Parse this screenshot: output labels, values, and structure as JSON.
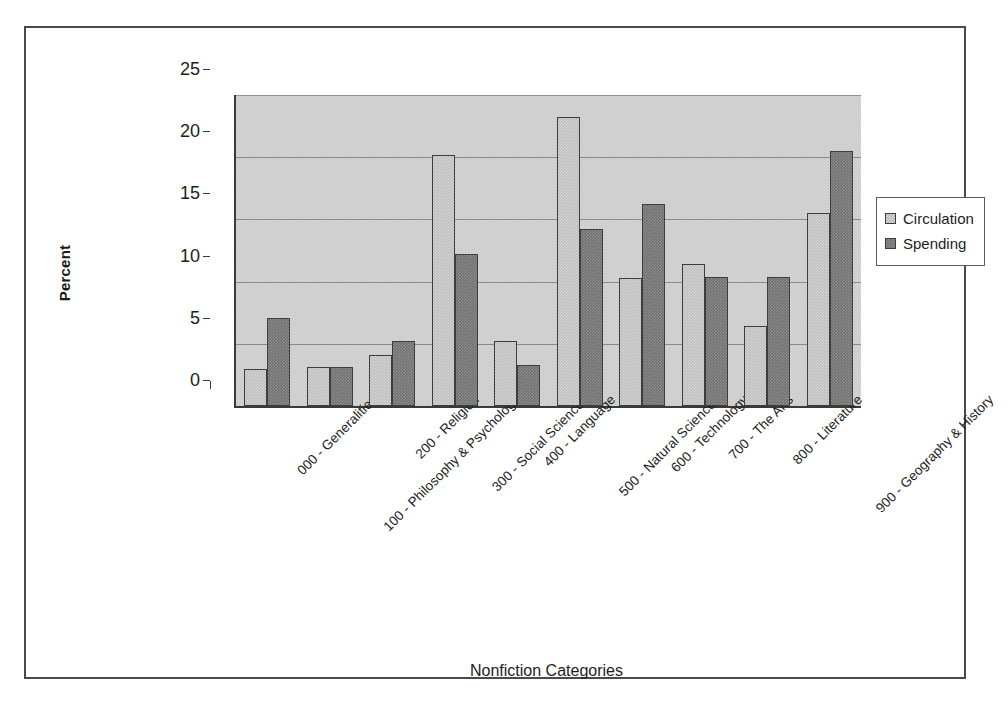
{
  "chart_data": {
    "type": "bar",
    "title": "",
    "xlabel": "Nonfiction Categories",
    "ylabel": "Percent",
    "ylim": [
      0,
      25
    ],
    "ytick_labels": [
      "25",
      "20",
      "15",
      "10",
      "5",
      "0"
    ],
    "ytick_values": [
      25,
      20,
      15,
      10,
      5,
      0
    ],
    "grid": true,
    "legend_position": "right",
    "categories": [
      "000 - Generalities",
      "100 - Philosophy & Psychology",
      "200 - Religion",
      "300 - Social Sciences",
      "400 - Language",
      "500 - Natural Sciences",
      "600 - Technology",
      "700 - The Arts",
      "800 - Literature",
      "900 - Geography & History"
    ],
    "series": [
      {
        "name": "Circulation",
        "color": "#bcbcbc",
        "values": [
          3.0,
          3.1,
          4.1,
          20.2,
          5.2,
          23.2,
          10.3,
          11.4,
          6.4,
          15.5
        ]
      },
      {
        "name": "Spending",
        "color": "#6f6f6f",
        "values": [
          7.1,
          3.1,
          5.2,
          12.2,
          3.3,
          14.2,
          16.2,
          10.4,
          10.4,
          20.5
        ]
      }
    ]
  },
  "legend": {
    "items": [
      {
        "label": "Circulation"
      },
      {
        "label": "Spending"
      }
    ]
  }
}
